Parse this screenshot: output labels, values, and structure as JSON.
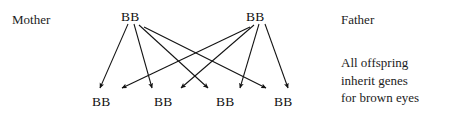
{
  "diagram": {
    "ink_color": "#121212",
    "background_color": "#ffffff",
    "labels": {
      "mother": "Mother",
      "father": "Father"
    },
    "parents": [
      {
        "id": "mother",
        "genotype": "BB",
        "x": 134,
        "y": 16
      },
      {
        "id": "father",
        "genotype": "BB",
        "x": 259,
        "y": 16
      }
    ],
    "offspring": [
      {
        "id": "child-1",
        "genotype": "BB",
        "x": 104,
        "y": 101
      },
      {
        "id": "child-2",
        "genotype": "BB",
        "x": 166,
        "y": 101
      },
      {
        "id": "child-3",
        "genotype": "BB",
        "x": 228,
        "y": 101
      },
      {
        "id": "child-4",
        "genotype": "BB",
        "x": 286,
        "y": 101
      }
    ],
    "caption": {
      "line1": "All offspring",
      "line2": "inherit genes",
      "line3": "for brown eyes"
    },
    "arrows": [
      {
        "from": "mother",
        "to": "child-1",
        "x1": 128,
        "y1": 24,
        "x2": 100,
        "y2": 90
      },
      {
        "from": "mother",
        "to": "child-2",
        "x1": 134,
        "y1": 24,
        "x2": 152,
        "y2": 90
      },
      {
        "from": "mother",
        "to": "child-3",
        "x1": 139,
        "y1": 25,
        "x2": 208,
        "y2": 90
      },
      {
        "from": "mother",
        "to": "child-4",
        "x1": 143,
        "y1": 27,
        "x2": 266,
        "y2": 90
      },
      {
        "from": "father",
        "to": "child-1",
        "x1": 250,
        "y1": 27,
        "x2": 122,
        "y2": 90
      },
      {
        "from": "father",
        "to": "child-2",
        "x1": 254,
        "y1": 25,
        "x2": 181,
        "y2": 90
      },
      {
        "from": "father",
        "to": "child-3",
        "x1": 259,
        "y1": 24,
        "x2": 240,
        "y2": 90
      },
      {
        "from": "father",
        "to": "child-4",
        "x1": 265,
        "y1": 24,
        "x2": 288,
        "y2": 90
      }
    ]
  }
}
